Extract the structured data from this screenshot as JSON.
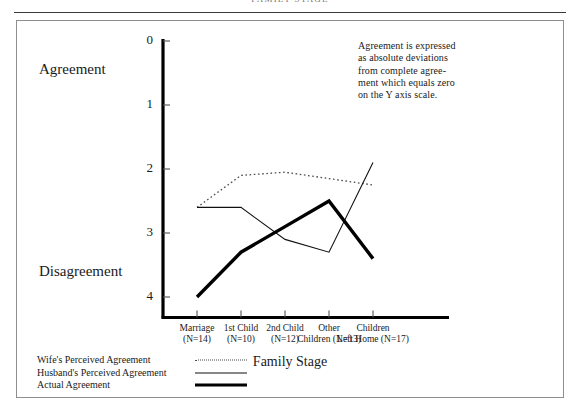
{
  "page": {
    "running_head": "FAMILY STAGE"
  },
  "annotation": {
    "note": "Agreement is expressed\nas absolute deviations\nfrom complete agree-\nment which equals zero\non the Y axis scale."
  },
  "axis_labels": {
    "top_pole": "Agreement",
    "bottom_pole": "Disagreement"
  },
  "chart_data": {
    "type": "line",
    "title": "",
    "xlabel": "Family Stage",
    "ylabel": "",
    "categories": [
      "Marriage\n(N=14)",
      "1st Child\n(N=10)",
      "2nd Child\n(N=12)",
      "Other\nChildren (N=13)",
      "Children\nLeft Home (N=17)"
    ],
    "category_names": [
      "Marriage",
      "1st Child",
      "2nd Child",
      "Other Children",
      "Children Left Home"
    ],
    "sample_sizes": [
      14,
      10,
      12,
      13,
      17
    ],
    "yticks": [
      0,
      1,
      2,
      3,
      4
    ],
    "ytick_labels": [
      "0",
      "1",
      "2",
      "3",
      "4"
    ],
    "ylim": [
      0,
      4.4
    ],
    "y_inverted": true,
    "grid": false,
    "legend_position": "bottom-left",
    "series": [
      {
        "name": "Wife's Perceived Agreement",
        "style": "dotted",
        "values": [
          2.6,
          2.1,
          2.05,
          2.15,
          2.25
        ]
      },
      {
        "name": "Husband's Perceived Agreement",
        "style": "thin-solid",
        "values": [
          2.6,
          2.6,
          3.1,
          3.3,
          1.9
        ]
      },
      {
        "name": "Actual Agreement",
        "style": "thick-solid",
        "values": [
          4.0,
          3.3,
          2.9,
          2.5,
          3.4
        ]
      }
    ]
  }
}
